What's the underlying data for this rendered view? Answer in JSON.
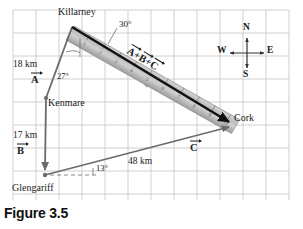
{
  "figure": {
    "caption": "Figure 3.5",
    "background_color": "#ffffff",
    "grid_color": "#c9c9c9",
    "vector_color": "#6b6b6b",
    "resultant_color": "#111111",
    "ruler_color": "#b8b8b8"
  },
  "cities": [
    {
      "name": "Killarney",
      "x": 63,
      "y": 12
    },
    {
      "name": "Kenmare",
      "x": 47,
      "y": 86
    },
    {
      "name": "Cork",
      "x": 234,
      "y": 119
    },
    {
      "name": "Glengariff",
      "x": 12,
      "y": 183
    }
  ],
  "vectors": {
    "a": {
      "label": "A",
      "magnitude": "18 km",
      "angle": "27°"
    },
    "b": {
      "label": "B",
      "magnitude": "17 km",
      "angle": ""
    },
    "c": {
      "label": "C",
      "magnitude": "48 km",
      "angle": "13°"
    },
    "resultant": {
      "label": "A + B + C",
      "angle": "30°"
    }
  },
  "labels": {
    "a_distance": "18 km",
    "a_vector": "A",
    "a_angle": "27°",
    "b_distance": "17 km",
    "b_vector": "B",
    "c_distance": "48 km",
    "c_vector": "C",
    "c_angle": "13°",
    "resultant_angle": "30°",
    "sum_a": "A",
    "sum_plus1": "+",
    "sum_b": "B",
    "sum_plus2": "+",
    "sum_c": "C"
  },
  "compass": {
    "north": "N",
    "south": "S",
    "east": "E",
    "west": "W",
    "center_x": 247,
    "center_y": 53
  },
  "ruler": {
    "tick_labels": [
      "1",
      "2",
      "3",
      "4",
      "5",
      "6",
      "7",
      "8",
      "9",
      "10"
    ],
    "unit_mark": "cm"
  }
}
